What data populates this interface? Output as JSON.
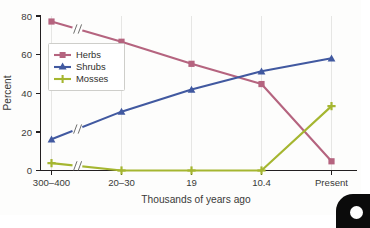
{
  "chart_data": {
    "type": "line",
    "title": "",
    "xlabel": "Thousands of years ago",
    "ylabel": "Percent",
    "categories": [
      "300–400",
      "20–30",
      "19",
      "10.4",
      "Present"
    ],
    "ylim": [
      0,
      84
    ],
    "yticks": [
      0,
      20,
      40,
      60,
      80
    ],
    "ytick_labels": [
      "0",
      "20",
      "40",
      "60",
      "80"
    ],
    "grid": "vertical-light",
    "legend_position": "upper-left-inside",
    "axis_break": "after first category on all series",
    "series": [
      {
        "name": "Herbs",
        "color": "#b5647f",
        "marker": "square",
        "values": [
          81,
          70,
          58,
          47,
          5
        ]
      },
      {
        "name": "Shrubs",
        "color": "#4159a0",
        "marker": "triangle",
        "values": [
          17,
          32,
          44,
          54,
          61
        ]
      },
      {
        "name": "Mosses",
        "color": "#a5b630",
        "marker": "plus",
        "values": [
          4,
          0,
          0,
          0,
          35
        ]
      }
    ]
  },
  "axis": {
    "y_title": "Percent",
    "x_title": "Thousands of years ago",
    "y_tick_0": "0",
    "y_tick_1": "20",
    "y_tick_2": "40",
    "y_tick_3": "60",
    "y_tick_4": "80",
    "x_tick_0": "300–400",
    "x_tick_1": "20–30",
    "x_tick_2": "19",
    "x_tick_3": "10.4",
    "x_tick_4": "Present"
  },
  "legend": {
    "items": [
      {
        "label": "Herbs",
        "color": "#b5647f"
      },
      {
        "label": "Shrubs",
        "color": "#4159a0"
      },
      {
        "label": "Mosses",
        "color": "#a5b630"
      }
    ],
    "item_0_label": "Herbs",
    "item_1_label": "Shrubs",
    "item_2_label": "Mosses"
  }
}
